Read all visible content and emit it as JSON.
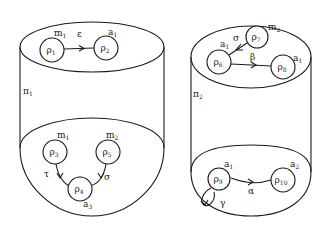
{
  "diagram": {
    "cylinders": [
      {
        "id": "pi1",
        "label": "π",
        "label_sub": "1",
        "top": {
          "nodes": [
            {
              "id": "rho1",
              "label": "ρ",
              "sub": "1",
              "tag": "m",
              "tag_sub": "1"
            },
            {
              "id": "rho2",
              "label": "ρ",
              "sub": "2",
              "tag": "a",
              "tag_sub": "1"
            }
          ],
          "edges": [
            {
              "from": "rho1",
              "to": "rho2",
              "label": "ε"
            }
          ]
        },
        "bottom": {
          "nodes": [
            {
              "id": "rho3",
              "label": "ρ",
              "sub": "3",
              "tag": "m",
              "tag_sub": "1"
            },
            {
              "id": "rho5",
              "label": "ρ",
              "sub": "5",
              "tag": "m",
              "tag_sub": "2"
            },
            {
              "id": "rho4",
              "label": "ρ",
              "sub": "4",
              "tag": "a",
              "tag_sub": "3"
            }
          ],
          "edges": [
            {
              "from": "rho3",
              "to": "rho4",
              "label": "τ"
            },
            {
              "from": "rho5",
              "to": "rho4",
              "label": "σ"
            }
          ]
        }
      },
      {
        "id": "pi2",
        "label": "π",
        "label_sub": "2",
        "top": {
          "nodes": [
            {
              "id": "rho7",
              "label": "ρ",
              "sub": "7",
              "tag": "m",
              "tag_sub": "2"
            },
            {
              "id": "rho6",
              "label": "ρ",
              "sub": "6",
              "tag": "a",
              "tag_sub": "1"
            },
            {
              "id": "rho8",
              "label": "ρ",
              "sub": "8",
              "tag": "a",
              "tag_sub": "1"
            }
          ],
          "edges": [
            {
              "from": "rho7",
              "to": "rho6",
              "label": "σ"
            },
            {
              "from": "rho6",
              "to": "rho8",
              "label": "β"
            }
          ]
        },
        "bottom": {
          "nodes": [
            {
              "id": "rho9",
              "label": "ρ",
              "sub": "9",
              "tag": "a",
              "tag_sub": "1"
            },
            {
              "id": "rho10",
              "label": "ρ",
              "sub": "10",
              "tag": "a",
              "tag_sub": "2"
            }
          ],
          "edges": [
            {
              "from": "rho9",
              "to": "rho10",
              "label": "α"
            },
            {
              "from": "rho9",
              "to": "rho9",
              "label": "γ"
            }
          ]
        }
      }
    ]
  },
  "colors": {
    "ink": "#1a1a1a",
    "background": "#ffffff"
  }
}
